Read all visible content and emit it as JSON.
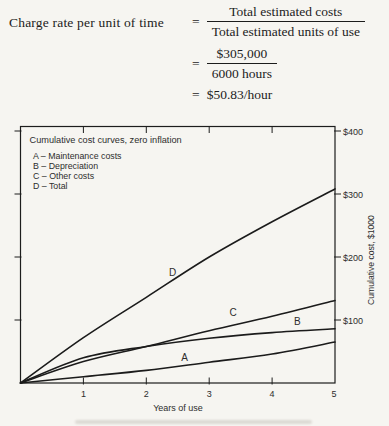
{
  "formula": {
    "lhs": "Charge rate per unit of time",
    "equals": "=",
    "step1": {
      "numerator": "Total estimated costs",
      "denominator": "Total estimated units of use"
    },
    "step2": {
      "numerator": "$305,000",
      "denominator": "6000 hours"
    },
    "result": "$50.83/hour"
  },
  "chart_data": {
    "type": "line",
    "title": "Cumulative cost curves, zero inflation",
    "xlabel": "Years of use",
    "ylabel": "Cumulative cost, $1000",
    "x": [
      0,
      1,
      2,
      3,
      4,
      5
    ],
    "x_tick_labels": [
      "1",
      "2",
      "3",
      "4",
      "5"
    ],
    "y_tick_labels_top_to_bottom": [
      "$400",
      "$300",
      "$200",
      "$100"
    ],
    "xlim": [
      0,
      5
    ],
    "ylim": [
      0,
      405
    ],
    "grid": false,
    "legend_position": "top-left-inside",
    "legend": [
      "A – Maintenance costs",
      "B – Depreciation",
      "C – Other costs",
      "D – Total"
    ],
    "series": [
      {
        "name": "A",
        "label": "Maintenance costs",
        "values": [
          0,
          10,
          20,
          33,
          46,
          65
        ],
        "label_at": {
          "year": 2.61,
          "value": 41
        }
      },
      {
        "name": "B",
        "label": "Depreciation",
        "values": [
          0,
          40,
          58,
          71,
          80,
          86
        ],
        "label_at": {
          "year": 4.4,
          "value": 98
        }
      },
      {
        "name": "C",
        "label": "Other costs",
        "values": [
          0,
          34,
          58,
          83,
          106,
          131
        ],
        "label_at": {
          "year": 3.38,
          "value": 112
        }
      },
      {
        "name": "D",
        "label": "Total",
        "values": [
          0,
          72,
          136,
          200,
          256,
          308
        ],
        "label_at": {
          "year": 2.42,
          "value": 176
        }
      }
    ]
  }
}
